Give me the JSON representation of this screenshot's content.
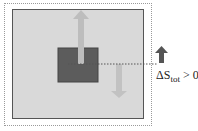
{
  "diagram": {
    "label_prefix": "ΔS",
    "label_subscript": "tot",
    "label_suffix": " > 0",
    "colors": {
      "background": "#d9d9d9",
      "block": "#5c5c5c",
      "light_arrow": "#bdbdbd",
      "dark_arrow": "#555555"
    }
  }
}
